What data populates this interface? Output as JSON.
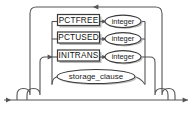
{
  "diagram": {
    "kind": "railroad-syntax-diagram",
    "width": 192,
    "height": 115,
    "background": "#ffffff",
    "line_color": "#555555",
    "box_border_color": "#3a3a3a",
    "shadow_color": "#bdbdbd",
    "text_color": "#111111",
    "entry_arrow": "arrow-right",
    "exit_arrow": "arrow-right",
    "loopback_arrow": "arrow-left",
    "branch_arrow": "arrow-right"
  },
  "branches": [
    {
      "id": "pctfree",
      "keyword": "PCTFREE",
      "keyword_shape": "rectangle",
      "argument": "integer",
      "argument_shape": "oval"
    },
    {
      "id": "pctused",
      "keyword": "PCTUSED",
      "keyword_shape": "rectangle",
      "argument": "integer",
      "argument_shape": "oval"
    },
    {
      "id": "initrans",
      "keyword": "INITRANS",
      "keyword_shape": "rectangle",
      "argument": "integer",
      "argument_shape": "oval"
    },
    {
      "id": "storage-clause",
      "keyword": "storage_clause",
      "keyword_shape": "oval",
      "argument": null,
      "argument_shape": null
    }
  ]
}
